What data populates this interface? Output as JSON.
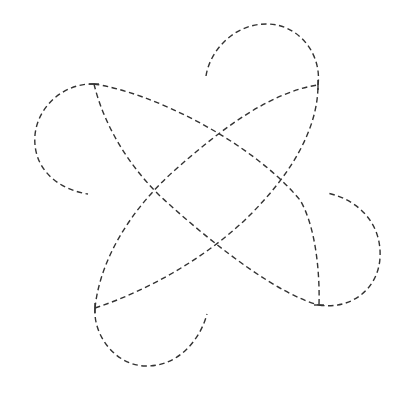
{
  "figure": {
    "type": "dashed-curve-knot",
    "stroke_color": "#333333",
    "background_color": "#ffffff",
    "vertices": {
      "top_left": [
        94,
        84
      ],
      "top_right": [
        318,
        85
      ],
      "bottom_right": [
        319,
        305
      ],
      "bottom_left": [
        95,
        308
      ]
    },
    "crossings": {
      "top": [
        207,
        145
      ],
      "left": [
        160,
        193
      ],
      "right": [
        254,
        193
      ],
      "bottom": [
        207,
        240
      ]
    },
    "open_arc_endpoints": {
      "top_arc": [
        206,
        76
      ],
      "left_arc": [
        88,
        194
      ],
      "right_arc": [
        327,
        193
      ],
      "bottom_arc": [
        207,
        314
      ]
    }
  }
}
